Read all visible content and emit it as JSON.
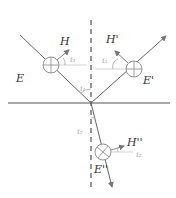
{
  "diagram": {
    "type": "reflection-refraction-polarization",
    "labels": {
      "E_incident": "E",
      "H_incident": "H",
      "E_reflected": "E'",
      "H_reflected": "H'",
      "E_refracted": "E''",
      "H_refracted": "H''",
      "angle_incident": "i₁",
      "angle_incident_normal": "i₁",
      "angle_reflected": "i₁",
      "angle_refracted": "i₂",
      "angle_refracted_normal": "i₂"
    },
    "colors": {
      "interface": "#555555",
      "rays": "#666666",
      "normal": "#444444",
      "angle_text": "#aaaaaa",
      "label_text": "#333333"
    }
  }
}
